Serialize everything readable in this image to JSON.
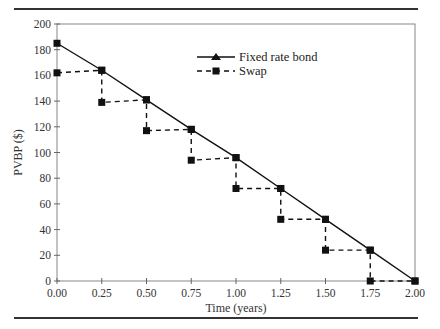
{
  "chart_data": {
    "type": "line",
    "title": "",
    "xlabel": "Time (years)",
    "ylabel": "PVBP ($)",
    "xlim": [
      0,
      2
    ],
    "ylim": [
      0,
      200
    ],
    "x_ticks": [
      "0.00",
      "0.25",
      "0.50",
      "0.75",
      "1.00",
      "1.25",
      "1.50",
      "1.75",
      "2.00"
    ],
    "y_ticks": [
      "0",
      "20",
      "40",
      "60",
      "80",
      "100",
      "120",
      "140",
      "160",
      "180",
      "200"
    ],
    "grid": false,
    "legend_position": "top-center",
    "series": [
      {
        "name": "Fixed rate bond",
        "style": "solid",
        "marker": "square",
        "color": "#111111",
        "points": [
          [
            0.0,
            185
          ],
          [
            0.25,
            164
          ],
          [
            0.5,
            141
          ],
          [
            0.75,
            118
          ],
          [
            1.0,
            96
          ],
          [
            1.25,
            72
          ],
          [
            1.5,
            48
          ],
          [
            1.75,
            24
          ],
          [
            2.0,
            0
          ]
        ]
      },
      {
        "name": "Swap",
        "style": "dashed",
        "marker": "square",
        "color": "#111111",
        "points": [
          [
            0.0,
            162
          ],
          [
            0.25,
            164
          ],
          [
            0.25,
            139
          ],
          [
            0.5,
            141
          ],
          [
            0.5,
            117
          ],
          [
            0.75,
            118
          ],
          [
            0.75,
            94
          ],
          [
            1.0,
            96
          ],
          [
            1.0,
            72
          ],
          [
            1.25,
            72
          ],
          [
            1.25,
            48
          ],
          [
            1.5,
            48
          ],
          [
            1.5,
            24
          ],
          [
            1.75,
            24
          ],
          [
            1.75,
            0
          ],
          [
            2.0,
            0
          ]
        ]
      }
    ]
  }
}
